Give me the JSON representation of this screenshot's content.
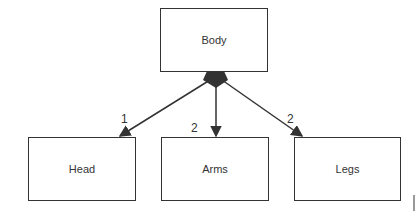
{
  "diagram": {
    "parent": {
      "label": "Body"
    },
    "children": [
      {
        "label": "Head",
        "multiplicity": "1"
      },
      {
        "label": "Arms",
        "multiplicity": "2"
      },
      {
        "label": "Legs",
        "multiplicity": "2"
      }
    ],
    "colors": {
      "stroke": "#333333",
      "background": "#ffffff"
    }
  }
}
